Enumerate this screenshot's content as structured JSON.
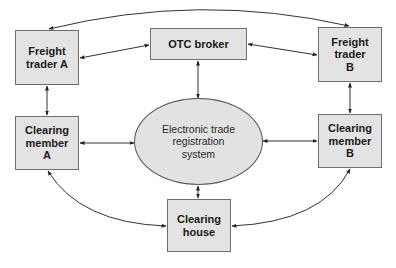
{
  "diagram": {
    "nodes": {
      "freight_trader_a": {
        "label": "Freight\ntrader A"
      },
      "otc_broker": {
        "label": "OTC broker"
      },
      "freight_trader_b": {
        "label": "Freight\ntrader\nB"
      },
      "clearing_member_a": {
        "label": "Clearing\nmember\nA"
      },
      "electronic_trade_registration_system": {
        "label": "Electronic trade\nregistration\nsystem"
      },
      "clearing_member_b": {
        "label": "Clearing\nmember\nB"
      },
      "clearing_house": {
        "label": "Clearing\nhouse"
      }
    },
    "edges": [
      {
        "from": "freight_trader_a",
        "to": "freight_trader_b",
        "style": "curved-top",
        "arrows": "both"
      },
      {
        "from": "freight_trader_a",
        "to": "otc_broker",
        "arrows": "both"
      },
      {
        "from": "otc_broker",
        "to": "freight_trader_b",
        "arrows": "both"
      },
      {
        "from": "freight_trader_a",
        "to": "clearing_member_a",
        "arrows": "both"
      },
      {
        "from": "freight_trader_b",
        "to": "clearing_member_b",
        "arrows": "both"
      },
      {
        "from": "otc_broker",
        "to": "electronic_trade_registration_system",
        "arrows": "both"
      },
      {
        "from": "clearing_member_a",
        "to": "electronic_trade_registration_system",
        "arrows": "both"
      },
      {
        "from": "electronic_trade_registration_system",
        "to": "clearing_member_b",
        "arrows": "both"
      },
      {
        "from": "electronic_trade_registration_system",
        "to": "clearing_house",
        "arrows": "both"
      },
      {
        "from": "clearing_member_a",
        "to": "clearing_house",
        "style": "curved",
        "arrows": "both"
      },
      {
        "from": "clearing_member_b",
        "to": "clearing_house",
        "style": "curved",
        "arrows": "both"
      }
    ],
    "colors": {
      "node_fill": "#e3e3e3",
      "node_border": "#6e6e6e",
      "line": "#222222"
    }
  }
}
